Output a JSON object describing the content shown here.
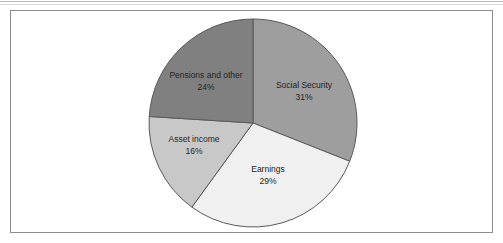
{
  "chart_data": {
    "type": "pie",
    "title": "",
    "subtitle": "",
    "xlabel": "",
    "ylabel": "",
    "legend": "none",
    "grid": false,
    "units": "percent",
    "total": 100,
    "start_angle_deg": 0,
    "direction": "clockwise",
    "categories": [
      "Social Security",
      "Earnings",
      "Asset income",
      "Pensions and other"
    ],
    "values": [
      31,
      29,
      16,
      24
    ],
    "slices": [
      {
        "label": "Social Security",
        "value": 31,
        "value_text": "31%",
        "color": "#9e9e9e",
        "start_deg": 0,
        "end_deg": 111.6,
        "label_x": 304,
        "label_y": 88,
        "value_x": 304,
        "value_y": 100
      },
      {
        "label": "Earnings",
        "value": 29,
        "value_text": "29%",
        "color": "#f0f0f0",
        "start_deg": 111.6,
        "end_deg": 216.0,
        "label_x": 268,
        "label_y": 172,
        "value_x": 268,
        "value_y": 184
      },
      {
        "label": "Asset income",
        "value": 16,
        "value_text": "16%",
        "color": "#c8c8c8",
        "start_deg": 216.0,
        "end_deg": 273.6,
        "label_x": 194,
        "label_y": 142,
        "value_x": 194,
        "value_y": 154
      },
      {
        "label": "Pensions and other",
        "value": 24,
        "value_text": "24%",
        "color": "#808080",
        "start_deg": 273.6,
        "end_deg": 360.0,
        "label_x": 206,
        "label_y": 78,
        "value_x": 206,
        "value_y": 90
      }
    ],
    "geometry": {
      "center_x": 253,
      "center_y": 123,
      "radius": 104
    },
    "style": {
      "slice_border_color": "#595959",
      "frame_border_color": "#8c8c8c",
      "background": "#ffffff",
      "text_color": "#231f20"
    }
  }
}
